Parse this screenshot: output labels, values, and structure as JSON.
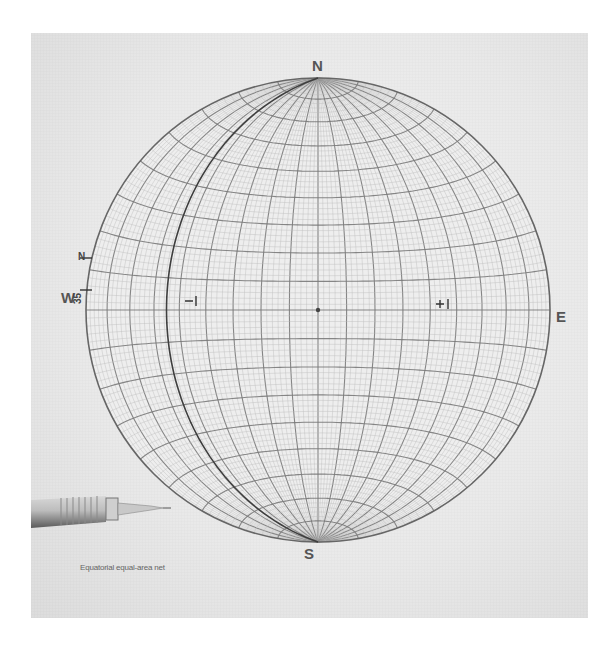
{
  "figure": {
    "type": "stereonet",
    "caption": "Equatorial equal-area net",
    "compass": {
      "north": "N",
      "south": "S",
      "east": "E",
      "west": "W"
    },
    "overlay_labels": {
      "strike_mark": "N",
      "azimuth_value": "35"
    },
    "grid": {
      "projection": "equal-area (Schmidt)",
      "major_interval_deg": 10,
      "minor_interval_deg": 2
    },
    "traced_great_circle": {
      "description": "Great circle traced on overlay through N and S poles, passing near W edge",
      "tick_marks": [
        "W-side intercept",
        "E-side intercept",
        "center point"
      ]
    },
    "tool_in_photo": "mechanical pencil",
    "colors": {
      "background": "#ffffff",
      "paper": "#ebebeb",
      "grid_major": "#7a7a7a",
      "grid_minor": "#b8b8b8",
      "traced_line": "#3e3e3e",
      "label": "#555555"
    }
  }
}
